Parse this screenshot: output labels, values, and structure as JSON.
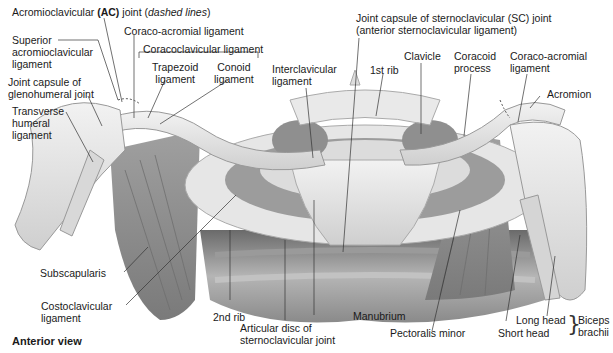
{
  "figure": {
    "view_label": "Anterior view",
    "labels": {
      "ac_joint_pre": "Acromioclavicular ",
      "ac_joint_bold": "(AC)",
      "ac_joint_mid": " joint (",
      "ac_joint_italic": "dashed lines",
      "ac_joint_post": ")",
      "superior_ac_lig_1": "Superior",
      "superior_ac_lig_2": "acromioclavicular",
      "superior_ac_lig_3": "ligament",
      "coraco_acromial_left": "Coraco-acromial ligament",
      "coracoclavicular": "Coracoclavicular ligament",
      "trapezoid_1": "Trapezoid",
      "trapezoid_2": "ligament",
      "conoid_1": "Conoid",
      "conoid_2": "ligament",
      "glenohumeral_1": "Joint capsule of",
      "glenohumeral_2": "glenohumeral joint",
      "transverse_1": "Transverse",
      "transverse_2": "humeral",
      "transverse_3": "ligament",
      "interclavicular_1": "Interclavicular",
      "interclavicular_2": "ligament",
      "sc_capsule_1": "Joint capsule of sternoclavicular (SC) joint",
      "sc_capsule_2": "(anterior sternoclavicular ligament)",
      "first_rib": "1st rib",
      "clavicle": "Clavicle",
      "coracoid_1": "Coracoid",
      "coracoid_2": "process",
      "coraco_acromial_right_1": "Coraco-acromial",
      "coraco_acromial_right_2": "ligament",
      "acromion": "Acromion",
      "subscapularis": "Subscapularis",
      "costoclavicular_1": "Costoclavicular",
      "costoclavicular_2": "ligament",
      "second_rib": "2nd rib",
      "articular_disc_1": "Articular disc of",
      "articular_disc_2": "sternoclavicular joint",
      "manubrium": "Manubrium",
      "pectoralis_minor": "Pectoralis minor",
      "long_head": "Long head",
      "short_head": "Short head",
      "biceps_1": "Biceps",
      "biceps_2": "brachii"
    },
    "colors": {
      "bone": "#e4e4e4",
      "bone_shade": "#c9c9c9",
      "muscle": "#8d8d8d",
      "muscle_dark": "#6f6f6f",
      "leader_line": "#333333"
    }
  }
}
